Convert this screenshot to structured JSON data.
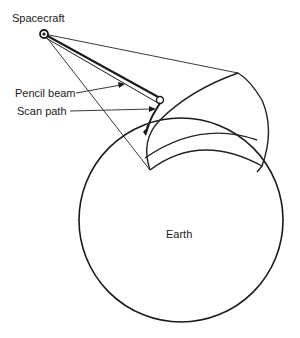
{
  "diagram": {
    "labels": {
      "spacecraft": "Spacecraft",
      "pencil_beam": "Pencil beam",
      "scan_path": "Scan path",
      "earth": "Earth"
    },
    "colors": {
      "ink": "#1a1a1a",
      "background": "#ffffff"
    }
  }
}
